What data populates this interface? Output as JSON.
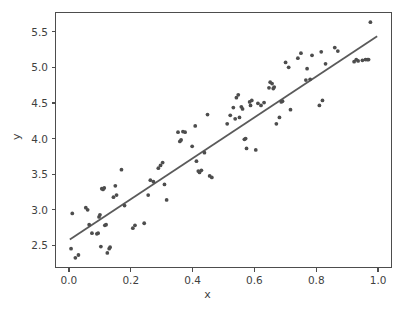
{
  "chart_data": {
    "type": "scatter",
    "title": "",
    "xlabel": "x",
    "ylabel": "y",
    "xlim": [
      -0.045,
      1.045
    ],
    "ylim": [
      2.18,
      5.78
    ],
    "grid": false,
    "legend": null,
    "marker_color": "#4d4d4d",
    "line_color": "#5a5a5a",
    "xticks": [
      0.0,
      0.2,
      0.4,
      0.6,
      0.8,
      1.0
    ],
    "xticklabels": [
      "0.0",
      "0.2",
      "0.4",
      "0.6",
      "0.8",
      "1.0"
    ],
    "yticks": [
      2.5,
      3.0,
      3.5,
      4.0,
      4.5,
      5.0,
      5.5
    ],
    "yticklabels": [
      "2.5",
      "3.0",
      "3.5",
      "4.0",
      "4.5",
      "5.0",
      "5.5"
    ],
    "series": [
      {
        "name": "observations",
        "type": "scatter",
        "points": [
          [
            0.004,
            2.44
          ],
          [
            0.008,
            2.94
          ],
          [
            0.018,
            2.31
          ],
          [
            0.028,
            2.35
          ],
          [
            0.052,
            3.02
          ],
          [
            0.058,
            2.99
          ],
          [
            0.063,
            2.78
          ],
          [
            0.072,
            2.66
          ],
          [
            0.088,
            2.65
          ],
          [
            0.092,
            2.66
          ],
          [
            0.095,
            2.89
          ],
          [
            0.098,
            2.92
          ],
          [
            0.101,
            2.47
          ],
          [
            0.104,
            3.29
          ],
          [
            0.108,
            3.28
          ],
          [
            0.112,
            3.3
          ],
          [
            0.114,
            2.77
          ],
          [
            0.118,
            2.78
          ],
          [
            0.122,
            2.38
          ],
          [
            0.128,
            2.44
          ],
          [
            0.131,
            2.46
          ],
          [
            0.142,
            3.17
          ],
          [
            0.148,
            3.33
          ],
          [
            0.152,
            3.2
          ],
          [
            0.168,
            3.56
          ],
          [
            0.178,
            3.05
          ],
          [
            0.205,
            2.73
          ],
          [
            0.212,
            2.77
          ],
          [
            0.242,
            2.8
          ],
          [
            0.255,
            3.2
          ],
          [
            0.262,
            3.41
          ],
          [
            0.272,
            3.39
          ],
          [
            0.288,
            3.58
          ],
          [
            0.295,
            3.62
          ],
          [
            0.302,
            3.66
          ],
          [
            0.308,
            3.35
          ],
          [
            0.315,
            3.13
          ],
          [
            0.352,
            4.09
          ],
          [
            0.358,
            3.96
          ],
          [
            0.362,
            3.98
          ],
          [
            0.368,
            4.1
          ],
          [
            0.375,
            4.09
          ],
          [
            0.398,
            3.89
          ],
          [
            0.408,
            4.18
          ],
          [
            0.412,
            3.68
          ],
          [
            0.418,
            3.54
          ],
          [
            0.422,
            3.52
          ],
          [
            0.428,
            3.55
          ],
          [
            0.438,
            3.8
          ],
          [
            0.448,
            4.34
          ],
          [
            0.455,
            3.47
          ],
          [
            0.462,
            3.45
          ],
          [
            0.512,
            4.21
          ],
          [
            0.522,
            4.33
          ],
          [
            0.532,
            4.44
          ],
          [
            0.538,
            4.28
          ],
          [
            0.542,
            4.58
          ],
          [
            0.548,
            4.62
          ],
          [
            0.552,
            4.3
          ],
          [
            0.558,
            4.45
          ],
          [
            0.562,
            4.42
          ],
          [
            0.568,
            3.99
          ],
          [
            0.572,
            4.0
          ],
          [
            0.575,
            3.86
          ],
          [
            0.585,
            4.52
          ],
          [
            0.588,
            4.47
          ],
          [
            0.592,
            4.54
          ],
          [
            0.605,
            3.84
          ],
          [
            0.612,
            4.5
          ],
          [
            0.622,
            4.47
          ],
          [
            0.632,
            4.51
          ],
          [
            0.648,
            4.72
          ],
          [
            0.652,
            4.8
          ],
          [
            0.658,
            4.78
          ],
          [
            0.662,
            4.71
          ],
          [
            0.665,
            4.73
          ],
          [
            0.672,
            4.21
          ],
          [
            0.682,
            4.3
          ],
          [
            0.688,
            4.52
          ],
          [
            0.692,
            4.53
          ],
          [
            0.702,
            5.08
          ],
          [
            0.712,
            5.01
          ],
          [
            0.718,
            4.41
          ],
          [
            0.742,
            5.14
          ],
          [
            0.752,
            5.21
          ],
          [
            0.768,
            4.83
          ],
          [
            0.772,
            4.99
          ],
          [
            0.782,
            4.84
          ],
          [
            0.788,
            5.18
          ],
          [
            0.812,
            4.47
          ],
          [
            0.818,
            5.23
          ],
          [
            0.822,
            4.54
          ],
          [
            0.832,
            5.06
          ],
          [
            0.862,
            5.29
          ],
          [
            0.872,
            5.24
          ],
          [
            0.925,
            5.09
          ],
          [
            0.932,
            5.12
          ],
          [
            0.938,
            5.1
          ],
          [
            0.952,
            5.11
          ],
          [
            0.962,
            5.12
          ],
          [
            0.968,
            5.12
          ],
          [
            0.972,
            5.12
          ],
          [
            0.978,
            5.65
          ]
        ]
      },
      {
        "name": "fit-line",
        "type": "line",
        "points": [
          [
            0.0,
            2.57
          ],
          [
            1.0,
            5.45
          ]
        ]
      }
    ]
  }
}
